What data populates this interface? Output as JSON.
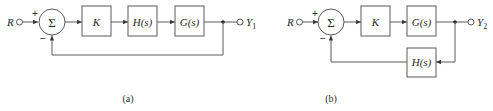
{
  "diagram_a": {
    "caption": "(a)",
    "input_label": "R",
    "summer_symbol": "Σ",
    "plus_sign": "+",
    "minus_sign": "−",
    "blocks": [
      {
        "label": "K"
      },
      {
        "label": "H(s)"
      },
      {
        "label": "G(s)"
      }
    ],
    "output_label": "Y",
    "output_subscript": "1",
    "feedback": "unity"
  },
  "diagram_b": {
    "caption": "(b)",
    "input_label": "R",
    "summer_symbol": "Σ",
    "plus_sign": "+",
    "minus_sign": "−",
    "blocks": [
      {
        "label": "K"
      },
      {
        "label": "G(s)"
      }
    ],
    "feedback_block": {
      "label": "H(s)"
    },
    "output_label": "Y",
    "output_subscript": "2"
  },
  "colors": {
    "stroke": "#5a5a5a",
    "text": "#2a2a2a",
    "background": "#ffffff"
  }
}
